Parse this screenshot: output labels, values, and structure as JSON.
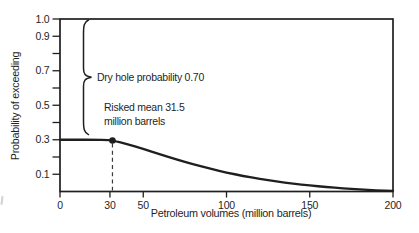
{
  "chart_data": {
    "type": "line",
    "title": "",
    "xlabel": "Petroleum volumes (million barrels)",
    "ylabel": "Probability of exceeding",
    "xlim": [
      0,
      200
    ],
    "ylim": [
      0,
      1.0
    ],
    "grid": false,
    "legend": false,
    "x_ticks": [
      {
        "v": 0,
        "label": "0"
      },
      {
        "v": 30,
        "label": "30"
      },
      {
        "v": 50,
        "label": "50"
      },
      {
        "v": 100,
        "label": "100"
      },
      {
        "v": 150,
        "label": "150"
      },
      {
        "v": 200,
        "label": "200"
      }
    ],
    "y_ticks": [
      {
        "v": 0.1,
        "label": "0.1"
      },
      {
        "v": 0.2,
        "label": ""
      },
      {
        "v": 0.3,
        "label": "0.3"
      },
      {
        "v": 0.4,
        "label": ""
      },
      {
        "v": 0.5,
        "label": "0.5"
      },
      {
        "v": 0.6,
        "label": ""
      },
      {
        "v": 0.7,
        "label": "0.7"
      },
      {
        "v": 0.8,
        "label": ""
      },
      {
        "v": 0.9,
        "label": "0.9"
      },
      {
        "v": 1.0,
        "label": "1.0"
      }
    ],
    "series": [
      {
        "name": "probability-of-exceeding-curve",
        "points": [
          [
            0,
            0.3
          ],
          [
            10,
            0.3
          ],
          [
            20,
            0.3
          ],
          [
            30,
            0.298
          ],
          [
            31.5,
            0.296
          ],
          [
            40,
            0.276
          ],
          [
            50,
            0.247
          ],
          [
            60,
            0.216
          ],
          [
            70,
            0.186
          ],
          [
            80,
            0.158
          ],
          [
            90,
            0.133
          ],
          [
            100,
            0.11
          ],
          [
            110,
            0.09
          ],
          [
            120,
            0.073
          ],
          [
            130,
            0.058
          ],
          [
            140,
            0.045
          ],
          [
            150,
            0.035
          ],
          [
            160,
            0.026
          ],
          [
            170,
            0.018
          ],
          [
            180,
            0.012
          ],
          [
            190,
            0.007
          ],
          [
            200,
            0.004
          ]
        ]
      }
    ],
    "marker": {
      "x": 31.5,
      "y": 0.296
    },
    "dashed_guide_x": 31.5,
    "brace_range": [
      0.33,
      1.0
    ],
    "annotations": {
      "dry_hole": {
        "text": "Dry hole probability 0.70"
      },
      "risked_mean": {
        "line1": "Risked mean 31.5",
        "line2": "million barrels"
      }
    },
    "colors": {
      "ink": "#1f1f1f",
      "background": "#ffffff"
    }
  }
}
